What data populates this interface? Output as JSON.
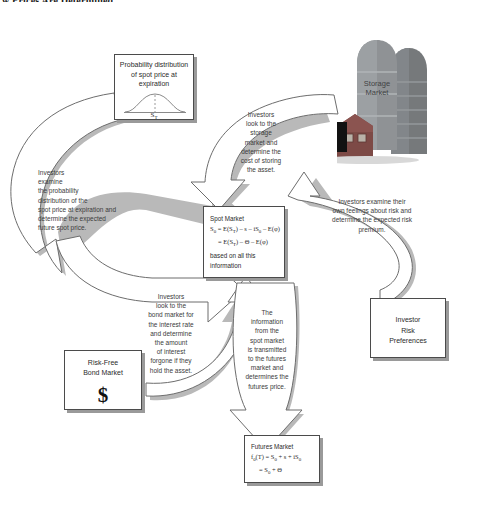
{
  "figure": {
    "title": "w Prices Are Determined"
  },
  "boxes": {
    "probability": {
      "name": "probability-distribution-box",
      "title": "Probability distribution of spot price at expiration",
      "axis_label": "S",
      "axis_label_sub": "T"
    },
    "spot_market": {
      "name": "spot-market-box",
      "title": "Spot Market",
      "formula_line1": "S₀ = E(S_T) − s − iS₀ − E(φ)",
      "formula_line1_parts": {
        "lhs": "S",
        "lhs_sub": "0",
        "eq": " = E(S",
        "t_sub": "T",
        "mid": ") – s – iS",
        "zero_sub": "0",
        "tail": " – E(φ)"
      },
      "formula_line2_parts": {
        "eq": "= E(S",
        "t_sub": "T",
        "mid": ") – Θ – E(φ)"
      },
      "note_line1": "based on all this",
      "note_line2": "information"
    },
    "futures_market": {
      "name": "futures-market-box",
      "title": "Futures Market",
      "formula_line1_parts": {
        "lhs": "f",
        "lhs_sub": "0",
        "eq": "(T) = S",
        "s_sub": "0",
        "mid": " + s + iS",
        "zero_sub": "0"
      },
      "formula_line2_parts": {
        "eq": "= S",
        "s_sub": "0",
        "tail": " + Θ"
      }
    },
    "investor_risk_preferences": {
      "name": "investor-risk-preferences-box",
      "line1": "Investor",
      "line2": "Risk",
      "line3": "Preferences"
    },
    "risk_free_bond_market": {
      "name": "risk-free-bond-market-box",
      "line1": "Risk-Free",
      "line2": "Bond Market",
      "symbol": "$"
    },
    "storage_market": {
      "name": "storage-market-illustration",
      "label_line1": "Storage",
      "label_line2": "Market"
    }
  },
  "arrows": {
    "probability_to_spot": {
      "name": "arrow-probability-to-spot",
      "text": "Investors\nexamine\nthe probability\ndistribution of the\nspot price at expiration and\ndetermine the expected\nfuture spot price."
    },
    "storage_to_spot": {
      "name": "arrow-storage-to-spot",
      "text": "Investors\nlook to the\nstorage\nmarket and\ndetermine the\ncost of storing\nthe asset."
    },
    "risk_to_spot": {
      "name": "arrow-risk-preferences-to-spot",
      "text": "Investors examine their\nown feelings about risk and\ndetermine the expected risk\npremium."
    },
    "bond_to_spot": {
      "name": "arrow-bond-market-to-spot",
      "text": "Investors\nlook to the\nbond market for\nthe interest rate\nand determine\nthe amount\nof interest\nforgone if they\nhold the asset."
    },
    "spot_to_futures": {
      "name": "arrow-spot-to-futures",
      "text": "The\ninformation\nfrom the\nspot market\nis transmitted\nto the futures\nmarket and\ndetermines the\nfutures price."
    }
  },
  "colors": {
    "box_border": "#4b4b4b",
    "box_shadow": "#9a9a9a",
    "arrow_stroke": "#6d6d6d",
    "arrow_shadow": "#b9b9b9",
    "silo_front": "#8d9090",
    "silo_back": "#6e7272",
    "barn": "#7d4a46",
    "truck": "#121212",
    "text": "#3b3b3b"
  }
}
